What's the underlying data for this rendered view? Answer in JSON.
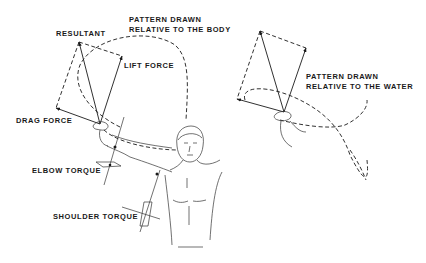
{
  "figure": {
    "type": "biomechanics-diagram",
    "colors": {
      "ink": "#1a1a1a",
      "background": "#ffffff"
    }
  },
  "labels": {
    "pattern_body_line1": "PATTERN DRAWN",
    "pattern_body_line2": "RELATIVE TO THE BODY",
    "resultant": "RESULTANT",
    "lift_force": "LIFT FORCE",
    "drag_force": "DRAG FORCE",
    "elbow_torque": "ELBOW TORQUE",
    "shoulder_torque": "SHOULDER TORQUE",
    "pattern_water_line1": "PATTERN DRAWN",
    "pattern_water_line2": "RELATIVE TO THE WATER"
  }
}
